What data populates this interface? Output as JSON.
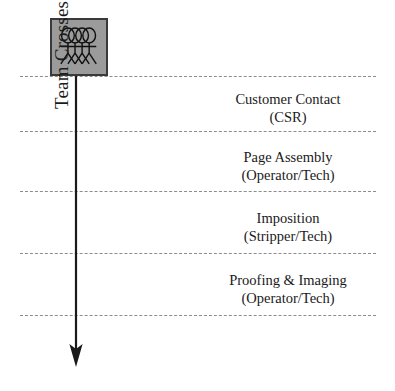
{
  "diagram": {
    "spine_label": "Team Crosses Bounderies",
    "icon": {
      "name": "team-network-icon",
      "fill_color": "#9b9b9b",
      "border_color": "#3a3a3a",
      "ring_count": 4
    },
    "arrow": {
      "name": "downward-flow-arrow",
      "color": "#1a1a1a",
      "direction": "down"
    },
    "boundary_line": {
      "style": "dashed",
      "color": "#8c8c8c",
      "count": 5
    },
    "boundaries": [
      {
        "id": "boundary-1",
        "y": 76
      },
      {
        "id": "boundary-2",
        "y": 131
      },
      {
        "id": "boundary-3",
        "y": 191
      },
      {
        "id": "boundary-4",
        "y": 253
      },
      {
        "id": "boundary-5",
        "y": 315
      }
    ],
    "stages": [
      {
        "id": "stage-customer-contact",
        "title": "Customer Contact",
        "role": "(CSR)",
        "y": 90
      },
      {
        "id": "stage-page-assembly",
        "title": "Page Assembly",
        "role": "(Operator/Tech)",
        "y": 148
      },
      {
        "id": "stage-imposition",
        "title": "Imposition",
        "role": "(Stripper/Tech)",
        "y": 209
      },
      {
        "id": "stage-proofing-imaging",
        "title": "Proofing & Imaging",
        "role": "(Operator/Tech)",
        "y": 271
      }
    ]
  }
}
